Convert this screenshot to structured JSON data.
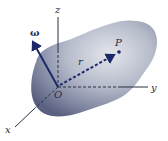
{
  "diagram": {
    "type": "rigid-body-rotation",
    "labels": {
      "z_axis": "z",
      "y_axis": "y",
      "x_axis": "x",
      "origin": "O",
      "point": "P",
      "position_vector": "r",
      "angular_velocity": "ω"
    },
    "colors": {
      "body_light": "#d8dbe3",
      "body_mid": "#9aa0b4",
      "body_dark": "#5a6180",
      "vector": "#1c2a6a",
      "axis": "#2a2e45",
      "background": "#ffffff"
    }
  }
}
